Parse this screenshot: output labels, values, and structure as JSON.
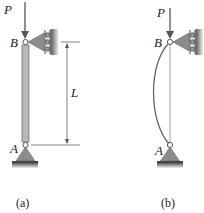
{
  "figure_a": {
    "caption": "(a)",
    "load_label": "P",
    "top_pin_label": "B",
    "bottom_pin_label": "A",
    "dimension_label": "L"
  },
  "figure_b": {
    "caption": "(b)",
    "load_label": "P",
    "top_pin_label": "B",
    "bottom_pin_label": "A"
  },
  "colors": {
    "column_fill": "#b4b4b4",
    "support_fill": "#8c8c8c",
    "ground_fill": "#6e6e6e",
    "line": "#555555"
  }
}
